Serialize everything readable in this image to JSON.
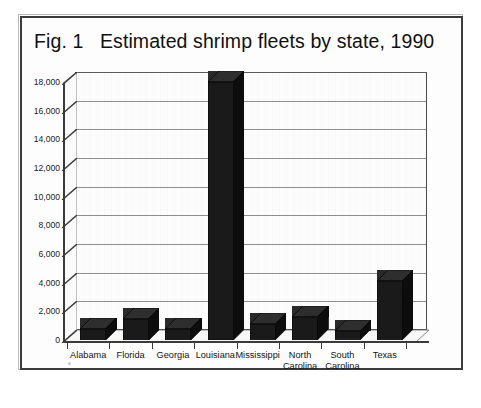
{
  "figure": {
    "title": "Fig. 1   Estimated shrimp fleets by state, 1990"
  },
  "chart_data": {
    "type": "bar",
    "title": "Fig. 1   Estimated shrimp fleets by state, 1990",
    "xlabel": "",
    "ylabel": "",
    "categories": [
      "Alabama",
      "Florida",
      "Georgia",
      "Louisiana",
      "Mississippi",
      "North\nCarolina",
      "South\nCarolina",
      "Texas"
    ],
    "values": [
      800,
      1500,
      800,
      18000,
      1100,
      1600,
      600,
      4100
    ],
    "ylim": [
      0,
      18000
    ],
    "ytick_values": [
      0,
      2000,
      4000,
      6000,
      8000,
      10000,
      12000,
      14000,
      16000,
      18000
    ],
    "ytick_labels": [
      "0",
      "2,000",
      "4,000",
      "6,000",
      "8,000",
      "10,000",
      "12,000",
      "14,000",
      "16,000",
      "18,000"
    ],
    "grid": true,
    "legend": null,
    "style": "3d-column",
    "bar_color": "#1a1a1a",
    "plot_background": "#fcfcfc",
    "gridline_color": "#8e8e8e"
  }
}
